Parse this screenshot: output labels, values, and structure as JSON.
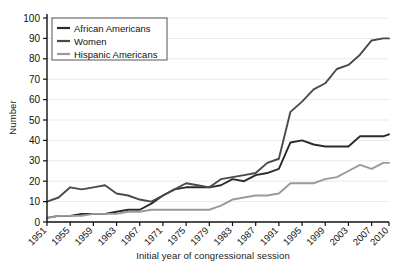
{
  "chart_data": {
    "type": "line",
    "title": "",
    "xlabel": "Initial year of congressional session",
    "ylabel": "Number",
    "xlim": [
      1951,
      2010
    ],
    "ylim": [
      0,
      100
    ],
    "grid": true,
    "legend_position": "top-left",
    "xticks": [
      1951,
      1955,
      1959,
      1963,
      1967,
      1971,
      1975,
      1979,
      1983,
      1987,
      1991,
      1995,
      1999,
      2003,
      2007,
      2010
    ],
    "yticks": [
      0,
      10,
      20,
      30,
      40,
      50,
      60,
      70,
      80,
      90,
      100
    ],
    "x": [
      1951,
      1953,
      1955,
      1957,
      1959,
      1961,
      1963,
      1965,
      1967,
      1969,
      1971,
      1973,
      1975,
      1977,
      1979,
      1981,
      1983,
      1985,
      1987,
      1989,
      1991,
      1993,
      1995,
      1997,
      1999,
      2001,
      2003,
      2005,
      2007,
      2009,
      2010
    ],
    "series": [
      {
        "name": "African Americans",
        "color": "#2b2b2b",
        "values": [
          2,
          3,
          3,
          4,
          4,
          4,
          5,
          6,
          6,
          9,
          13,
          16,
          17,
          17,
          17,
          18,
          21,
          20,
          23,
          24,
          26,
          39,
          40,
          38,
          37,
          37,
          37,
          42,
          42,
          42,
          43
        ]
      },
      {
        "name": "Women",
        "color": "#4a4a4a",
        "values": [
          10,
          12,
          17,
          16,
          17,
          18,
          14,
          13,
          11,
          10,
          13,
          16,
          19,
          18,
          17,
          21,
          22,
          23,
          24,
          29,
          31,
          54,
          59,
          65,
          68,
          75,
          77,
          82,
          89,
          90,
          90
        ]
      },
      {
        "name": "Hispanic Americans",
        "color": "#9a9a9a",
        "values": [
          2,
          3,
          3,
          3,
          4,
          4,
          4,
          5,
          5,
          6,
          6,
          6,
          6,
          6,
          6,
          8,
          11,
          12,
          13,
          13,
          14,
          19,
          19,
          19,
          21,
          22,
          25,
          28,
          26,
          29,
          29
        ]
      }
    ]
  },
  "legend": {
    "items": [
      {
        "label": "African Americans"
      },
      {
        "label": "Women"
      },
      {
        "label": "Hispanic Americans"
      }
    ]
  },
  "axes": {
    "x_title": "Initial year of congressional session",
    "y_title": "Number"
  }
}
